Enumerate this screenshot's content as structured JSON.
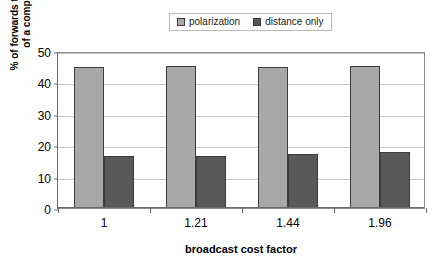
{
  "chart_data": {
    "type": "bar",
    "title": "",
    "subtitle": "",
    "xlabel": "broadcast cost factor",
    "ylabel": "% of forwards that form part of a complete path",
    "ylabel_lines": [
      "% of forwards that form part",
      "of a complete path"
    ],
    "categories": [
      "1",
      "1.21",
      "1.44",
      "1.96"
    ],
    "series": [
      {
        "name": "polarization",
        "color": "#a8a8a8",
        "values": [
          45.0,
          45.3,
          44.8,
          45.1
        ]
      },
      {
        "name": "distance only",
        "color": "#595959",
        "values": [
          16.5,
          16.7,
          17.3,
          17.8
        ]
      }
    ],
    "ylim": [
      0,
      50
    ],
    "yticks": [
      0,
      10,
      20,
      30,
      40,
      50
    ],
    "ytick_labels": [
      "0",
      "10",
      "20",
      "30",
      "40",
      "50"
    ],
    "grid": "horizontal",
    "legend_position": "top-center",
    "plot_background": "#ffffff",
    "grid_color": "#c6c6c6",
    "axis_color": "#6a6a6a",
    "bar_border_color": "#3c3c3c"
  }
}
